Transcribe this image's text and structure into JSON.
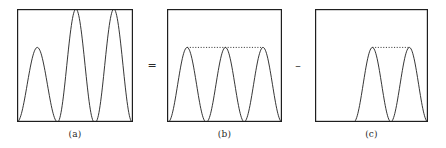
{
  "figure": {
    "kind": "math-illustration",
    "background_color": "#ffffff",
    "stroke_color": "#1f1f1f",
    "frame_color": "#1f1f1f",
    "dotted_color": "#2a2a2a"
  },
  "operators": [
    {
      "name": "equals",
      "symbol": "="
    },
    {
      "name": "minus",
      "symbol": "–"
    }
  ],
  "panels": [
    {
      "id": "a",
      "caption": "(a)",
      "box": {
        "x": 17,
        "y": 9,
        "w": 116,
        "h": 113
      },
      "dotted_line": null,
      "humps": [
        {
          "index": 1,
          "center_frac": 0.175,
          "half_width_frac": 0.175,
          "peak_height_frac": 0.66
        },
        {
          "index": 2,
          "center_frac": 0.508,
          "half_width_frac": 0.158,
          "peak_height_frac": 1.0
        },
        {
          "index": 3,
          "center_frac": 0.835,
          "half_width_frac": 0.158,
          "peak_height_frac": 1.0
        }
      ]
    },
    {
      "id": "b",
      "caption": "(b)",
      "box": {
        "x": 167,
        "y": 9,
        "w": 115,
        "h": 113
      },
      "dotted_line": {
        "y_frac": 0.66,
        "x_start_frac": 0.175,
        "x_end_frac": 0.835
      },
      "humps": [
        {
          "index": 1,
          "center_frac": 0.175,
          "half_width_frac": 0.165,
          "peak_height_frac": 0.66
        },
        {
          "index": 2,
          "center_frac": 0.508,
          "half_width_frac": 0.165,
          "peak_height_frac": 0.66
        },
        {
          "index": 3,
          "center_frac": 0.835,
          "half_width_frac": 0.165,
          "peak_height_frac": 0.66
        }
      ]
    },
    {
      "id": "c",
      "caption": "(c)",
      "box": {
        "x": 315,
        "y": 9,
        "w": 113,
        "h": 113
      },
      "dotted_line": {
        "y_frac": 0.66,
        "x_start_frac": 0.508,
        "x_end_frac": 0.835
      },
      "humps": [
        {
          "index": 2,
          "center_frac": 0.508,
          "half_width_frac": 0.165,
          "peak_height_frac": 0.66
        },
        {
          "index": 3,
          "center_frac": 0.835,
          "half_width_frac": 0.165,
          "peak_height_frac": 0.66
        }
      ]
    }
  ],
  "operator_positions": [
    {
      "name": "equals",
      "x": 142,
      "y": 60,
      "w": 20
    },
    {
      "name": "minus",
      "x": 288,
      "y": 60,
      "w": 20
    }
  ],
  "chart_data": {
    "type": "line",
    "title": "",
    "xlabel": "",
    "ylabel": "",
    "grid": false,
    "legend": null,
    "panels": [
      {
        "name": "(a)",
        "series": [
          {
            "name": "combined-wave",
            "comment": "one low hump followed by two full-height humps",
            "peaks": [
              0.66,
              1.0,
              1.0
            ],
            "valleys": [
              0.0,
              0.0,
              0.0
            ],
            "ylim": [
              0,
              1
            ]
          }
        ]
      },
      {
        "name": "(b)",
        "series": [
          {
            "name": "three-equal-humps",
            "comment": "three humps of identical height joined by a dotted level line",
            "peaks": [
              0.66,
              0.66,
              0.66
            ],
            "valleys": [
              0.0,
              0.0,
              0.0
            ],
            "ylim": [
              0,
              1
            ]
          }
        ]
      },
      {
        "name": "(c)",
        "series": [
          {
            "name": "two-humps",
            "comment": "two humps in the right portion joined by a dotted level line",
            "peaks": [
              0.66,
              0.66
            ],
            "valleys": [
              0.0,
              0.0
            ],
            "ylim": [
              0,
              1
            ]
          }
        ]
      }
    ]
  }
}
